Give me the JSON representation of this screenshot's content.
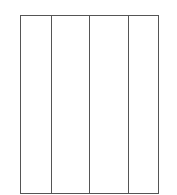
{
  "diagram": {
    "type": "column-layout",
    "frame": {
      "x": 20,
      "y": 15,
      "width": 137,
      "height": 177,
      "stroke": "#555555",
      "fill": "#ffffff"
    },
    "columns": [
      {
        "index": 0,
        "label": ""
      },
      {
        "index": 1,
        "label": ""
      },
      {
        "index": 2,
        "label": ""
      },
      {
        "index": 3,
        "label": ""
      }
    ],
    "dividers_x": [
      30,
      68,
      107
    ]
  }
}
